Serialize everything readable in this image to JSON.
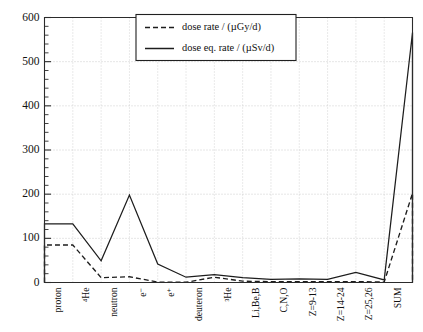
{
  "chart_data": {
    "type": "bar",
    "title": "",
    "subtitle": "",
    "xlabel": "",
    "ylabel": "",
    "ylim": [
      0,
      600
    ],
    "ytick_values": [
      0,
      100,
      200,
      300,
      400,
      500,
      600
    ],
    "ytick_labels": [
      "0",
      "100",
      "200",
      "300",
      "400",
      "500",
      "600"
    ],
    "y_minor_tick_step": 20,
    "grid": "horizontal-and-vertical dotted",
    "legend_position": "top-center",
    "categories": [
      "proton",
      "⁴He",
      "neutron",
      "e⁻",
      "e⁺",
      "deuteron",
      "³He",
      "Li,Be,B",
      "C,N,O",
      "Z=9-13",
      "Z=14-24",
      "Z=25,26",
      "SUM"
    ],
    "series": [
      {
        "name": "dose rate / (µGy/d)",
        "style": "dashed",
        "color": "#1d1d1d",
        "unit": "µGy/d",
        "values": [
          85,
          11,
          13,
          1,
          0.5,
          12,
          3,
          2,
          2,
          2,
          2,
          1,
          202
        ]
      },
      {
        "name": "dose eq. rate / (µSv/d)",
        "style": "solid",
        "color": "#1d1d1d",
        "unit": "µSv/d",
        "values": [
          133,
          49,
          198,
          42,
          12,
          18,
          11,
          7,
          8,
          7,
          23,
          6,
          566
        ]
      }
    ]
  },
  "legend": {
    "entries": [
      {
        "label": "dose rate / (µGy/d)",
        "style": "dashed"
      },
      {
        "label": "dose eq. rate / (µSv/d)",
        "style": "solid"
      }
    ]
  },
  "colors": {
    "ink": "#1d1d1d",
    "grid": "#b9b9b9",
    "background": "#ffffff"
  }
}
